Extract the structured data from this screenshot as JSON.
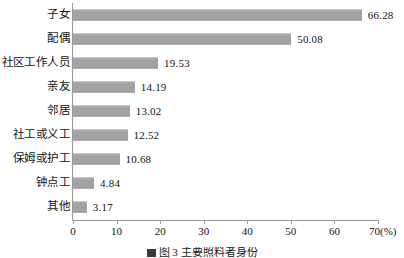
{
  "chart_data": {
    "type": "bar",
    "orientation": "horizontal",
    "title": "",
    "xlabel": "(%)",
    "ylabel": "",
    "xlim": [
      0,
      70
    ],
    "xticks": [
      0,
      10,
      20,
      30,
      40,
      50,
      60,
      70
    ],
    "xtick_labels": [
      "0",
      "10",
      "20",
      "30",
      "40",
      "50",
      "60",
      "70"
    ],
    "unit_label": "(%)",
    "last_tick_with_unit": "70(%)",
    "grid": false,
    "legend": false,
    "bar_color": "#a3a3a3",
    "axis_color": "#9a9a9a",
    "categories": [
      "子女",
      "配偶",
      "社区工作人员",
      "亲友",
      "邻居",
      "社工或义工",
      "保姆或护工",
      "钟点工",
      "其他"
    ],
    "values": [
      66.28,
      50.08,
      19.53,
      14.19,
      13.02,
      12.52,
      10.68,
      4.84,
      3.17
    ],
    "value_labels": [
      "66.28",
      "50.08",
      "19.53",
      "14.19",
      "13.02",
      "12.52",
      "10.68",
      "4.84",
      "3.17"
    ]
  },
  "caption": {
    "text": "图 3  主要照料者身份",
    "truncated": true
  }
}
